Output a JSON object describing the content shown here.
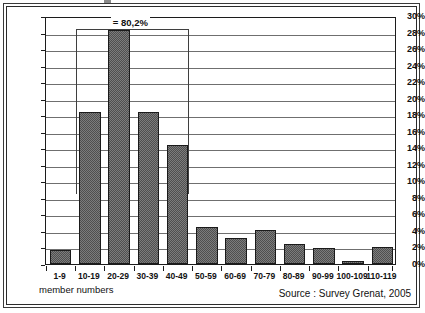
{
  "chart_data": {
    "type": "bar",
    "title": "",
    "subtitle": "",
    "xlabel": "member numbers",
    "ylabel": "",
    "categories": [
      "1-9",
      "10-19",
      "20-29",
      "30-39",
      "40-49",
      "50-59",
      "60-69",
      "70-79",
      "80-89",
      "90-99",
      "100-109",
      "110-119"
    ],
    "values": [
      1.7,
      18.4,
      28.3,
      18.4,
      14.4,
      4.5,
      3.2,
      4.1,
      2.4,
      1.9,
      0.4,
      2.0
    ],
    "ylim": [
      0,
      30
    ],
    "ytick_labels": [
      "0%",
      "2%",
      "4%",
      "6%",
      "8%",
      "10%",
      "12%",
      "14%",
      "16%",
      "18%",
      "20%",
      "22%",
      "24%",
      "26%",
      "28%",
      "30%"
    ],
    "ytick_values": [
      0,
      2,
      4,
      6,
      8,
      10,
      12,
      14,
      16,
      18,
      20,
      22,
      24,
      26,
      28,
      30
    ],
    "grid": true,
    "legend": "none",
    "annotations": [
      {
        "label": "= 80,2%",
        "spans_categories": [
          "10-19",
          "20-29",
          "30-39",
          "40-49"
        ],
        "value": 80.2
      }
    ],
    "bar_color": "#7c7c7c",
    "bar_edge_color": "#1a1a1a",
    "grid_color": "#6f6f6f"
  },
  "footer": {
    "source": "Source : Survey Grenat, 2005"
  }
}
